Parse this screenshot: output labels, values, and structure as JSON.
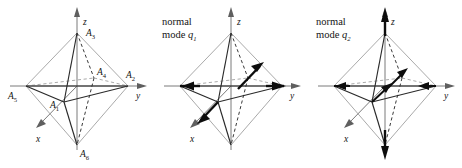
{
  "figure": {
    "type": "octahedron-normal-modes-diagram",
    "background": "#ffffff",
    "ink_color": "#1a1a1a",
    "panels": [
      {
        "id": "panel-1",
        "caption": "",
        "caption_line1": "",
        "caption_line2": "",
        "axes": [
          {
            "name": "z",
            "label": "z",
            "direction": "up"
          },
          {
            "name": "y",
            "label": "y",
            "direction": "right"
          },
          {
            "name": "x",
            "label": "x",
            "direction": "down-left"
          }
        ],
        "vertices": [
          {
            "id": "A3",
            "label": "A",
            "sub": "3",
            "position": "top (+z)"
          },
          {
            "id": "A2",
            "label": "A",
            "sub": "2",
            "position": "right (+y)"
          },
          {
            "id": "A5",
            "label": "A",
            "sub": "5",
            "position": "left (-y)"
          },
          {
            "id": "A6",
            "label": "A",
            "sub": "6",
            "position": "bottom (-z)"
          },
          {
            "id": "A1",
            "label": "A",
            "sub": "1",
            "position": "front (+x)"
          },
          {
            "id": "A4",
            "label": "A",
            "sub": "4",
            "position": "back (-x)"
          }
        ],
        "displacement_arrows": []
      },
      {
        "id": "panel-2",
        "caption": "normal mode q1",
        "caption_line1": "normal",
        "caption_line2_word": "mode",
        "caption_line2_symbol": "q",
        "caption_line2_sub": "1",
        "axes": [
          {
            "name": "z",
            "label": "z",
            "direction": "up"
          },
          {
            "name": "y",
            "label": "y",
            "direction": "right"
          },
          {
            "name": "x",
            "label": "x",
            "direction": "down-left"
          }
        ],
        "vertices": [],
        "displacement_arrows": [
          {
            "at": "A5 (left)",
            "direction": "right (+y)"
          },
          {
            "at": "A2 (right)",
            "direction": "right (+y)"
          },
          {
            "at": "A4 (back)",
            "direction": "up-right"
          },
          {
            "at": "A1 (front)",
            "direction": "down-left"
          }
        ]
      },
      {
        "id": "panel-3",
        "caption": "normal mode q2",
        "caption_line1": "normal",
        "caption_line2_word": "mode",
        "caption_line2_symbol": "q",
        "caption_line2_sub": "2",
        "axes": [
          {
            "name": "z",
            "label": "z",
            "direction": "up"
          },
          {
            "name": "y",
            "label": "y",
            "direction": "right"
          },
          {
            "name": "x",
            "label": "x",
            "direction": "down-left"
          }
        ],
        "vertices": [],
        "displacement_arrows": [
          {
            "at": "A3 (top)",
            "direction": "up (+z)"
          },
          {
            "at": "A6 (bottom)",
            "direction": "down (-z)"
          },
          {
            "at": "A5 (left)",
            "direction": "right (+y)"
          },
          {
            "at": "A2 (right)",
            "direction": "left (-y)"
          },
          {
            "at": "A4 (back)",
            "direction": "up-right"
          },
          {
            "at": "A1 (front)",
            "direction": "up-right"
          }
        ]
      }
    ]
  }
}
